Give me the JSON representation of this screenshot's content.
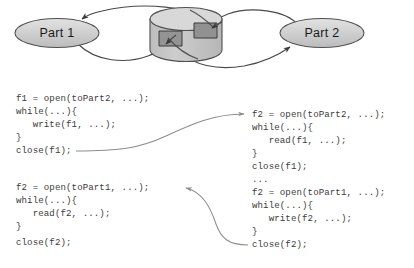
{
  "diagram": {
    "nodes": [
      {
        "id": "part1",
        "label": "Part 1"
      },
      {
        "id": "part2",
        "label": "Part 2"
      }
    ],
    "store": {
      "name": "shared-store-cylinder",
      "regions": [
        "region-left",
        "region-right"
      ]
    },
    "colors": {
      "node_fill": "#cfcfcf",
      "node_stroke": "#4f4f4f",
      "cylinder_fill": "#c8c8c8",
      "cylinder_top_fill": "#d6d6d6",
      "region_fill": "#8f8f8f",
      "region_stroke": "#3a3a3a",
      "arc_stroke": "#4a4a4a",
      "connector_stroke": "#8d8d8d",
      "code_text": "#3b3b3b"
    }
  },
  "code": {
    "left_top": {
      "name": "left-upper-code-block",
      "lines": [
        "f1 = open(toPart2, ...);",
        "while(...){",
        "   write(f1, ...);",
        "}",
        "close(f1);"
      ]
    },
    "left_bottom": {
      "name": "left-lower-code-block",
      "lines": [
        "f2 = open(toPart1, ...);",
        "while(...){",
        "   read(f2, ...);",
        "}",
        "close(f2);"
      ]
    },
    "right": {
      "name": "right-code-block",
      "lines": [
        "f2 = open(toPart2, ...);",
        "while(...){",
        "   read(f1, ...);",
        "}",
        "close(f1);",
        "...",
        "f2 = open(toPart1, ...);",
        "while(...){",
        "   write(f2, ...);",
        "}",
        "close(f2);"
      ]
    }
  },
  "connectors": [
    {
      "name": "connector-close-f1-to-right-open",
      "from": "left_top.close",
      "to": "right.open_toPart2"
    },
    {
      "name": "connector-close-f2-to-left-open",
      "from": "right.close_f2",
      "to": "left_bottom.open_toPart1"
    }
  ]
}
